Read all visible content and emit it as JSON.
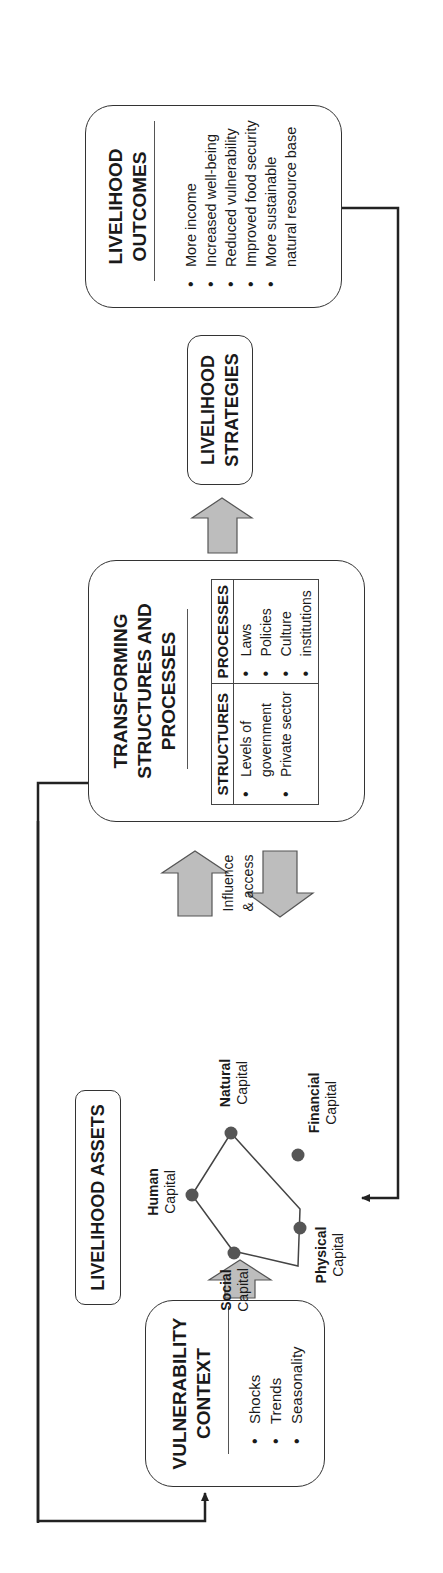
{
  "diagram": {
    "orientation": "rotated 90 degrees counter-clockwise",
    "vulnerability_context": {
      "title_line1": "VULNERABILITY",
      "title_line2": "CONTEXT",
      "items": [
        "Shocks",
        "Trends",
        "Seasonality"
      ]
    },
    "livelihood_assets": {
      "title": "LIVELIHOOD ASSETS",
      "capitals": [
        {
          "bold": "Human",
          "label": "Capital"
        },
        {
          "bold": "Natural",
          "label": "Capital"
        },
        {
          "bold": "Financial",
          "label": "Capital"
        },
        {
          "bold": "Physical",
          "label": "Capital"
        },
        {
          "bold": "Social",
          "label": "Capital"
        }
      ]
    },
    "influence_label_line1": "Influence",
    "influence_label_line2": "& access",
    "transforming": {
      "title_line1": "TRANSFORMING",
      "title_line2": "STRUCTURES AND",
      "title_line3": "PROCESSES",
      "structures_header": "STRUCTURES",
      "structures_items": [
        "Levels of government",
        "Private sector"
      ],
      "processes_header": "PROCESSES",
      "processes_items": [
        "Laws",
        "Policies",
        "Culture",
        "institutions"
      ]
    },
    "strategies": {
      "title_line1": "LIVELIHOOD",
      "title_line2": "STRATEGIES"
    },
    "outcomes": {
      "title_line1": "LIVELIHOOD",
      "title_line2": "OUTCOMES",
      "items": [
        "More income",
        "Increased well-being",
        "Reduced vulnerability",
        "Improved food security",
        "More sustainable natural resource base"
      ]
    },
    "colors": {
      "arrow_fill": "#bdbdbd",
      "arrow_stroke": "#555555",
      "node_fill": "#555555",
      "line": "#222222"
    }
  }
}
